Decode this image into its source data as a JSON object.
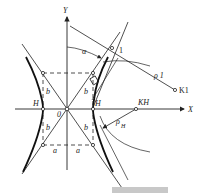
{
  "diagram": {
    "axes": {
      "x_label": "X",
      "y_label": "Y",
      "origin_label": "0"
    },
    "labels": {
      "vertex_left": "H",
      "vertex_right": "H",
      "semi_axis_a_left": "a",
      "semi_axis_a_right": "a",
      "semi_axis_b_upper_left": "b",
      "semi_axis_b_upper_right": "b",
      "semi_axis_b_lower_left": "b",
      "semi_axis_b_lower_right": "b",
      "angle": "α",
      "point_1": "1",
      "center_K1": "K1",
      "center_KH": "KH",
      "radius_rho_1": "ρ 1",
      "radius_rho_H": "ρ",
      "radius_rho_H_sub": "H"
    },
    "colors": {
      "line": "#222222",
      "background": "#ffffff",
      "bar": "#c8c8c8"
    }
  }
}
